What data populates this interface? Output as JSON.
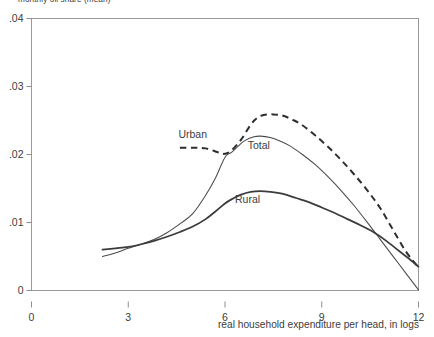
{
  "chart_data": {
    "type": "line",
    "title": "monthly oil share (mean)",
    "xlabel": "real household expenditure per head, in logs",
    "ylabel": "",
    "xlim": [
      0,
      12
    ],
    "ylim": [
      0,
      0.04
    ],
    "xticks": [
      0,
      3,
      6,
      9,
      12
    ],
    "xtick_labels": [
      "0",
      "3",
      "6",
      "9",
      "12"
    ],
    "yticks": [
      0,
      0.01,
      0.02,
      0.03,
      0.04
    ],
    "ytick_labels": [
      "0",
      ".01",
      ".02",
      ".03",
      ".04"
    ],
    "grid": false,
    "legend_position": "inline-annotations",
    "series": [
      {
        "name": "Urban",
        "style": "dashed",
        "label_x": 5.0,
        "label_y": 0.0225,
        "x": [
          4.6,
          5.0,
          5.4,
          5.8,
          6.0,
          6.2,
          6.5,
          6.8,
          7.0,
          7.2,
          7.5,
          7.8,
          8.1,
          8.4,
          8.8,
          9.2,
          9.6,
          10.0,
          10.4,
          10.8,
          11.2,
          11.6,
          12.0
        ],
        "y": [
          0.021,
          0.021,
          0.0209,
          0.0203,
          0.0201,
          0.0206,
          0.0222,
          0.0244,
          0.0254,
          0.0258,
          0.0259,
          0.0257,
          0.0251,
          0.0243,
          0.0228,
          0.0211,
          0.0192,
          0.0171,
          0.0148,
          0.0122,
          0.009,
          0.0058,
          0.0034
        ]
      },
      {
        "name": "Total",
        "style": "solid-thin",
        "label_x": 7.05,
        "label_y": 0.0208,
        "x": [
          2.2,
          2.6,
          3.0,
          3.4,
          3.8,
          4.2,
          4.6,
          5.0,
          5.4,
          5.7,
          6.0,
          6.2,
          6.4,
          6.6,
          6.9,
          7.1,
          7.4,
          7.7,
          8.0,
          8.4,
          8.8,
          9.2,
          9.6,
          10.0,
          10.4,
          10.8,
          11.2,
          11.6,
          12.0
        ],
        "y": [
          0.005,
          0.0055,
          0.0062,
          0.0068,
          0.0075,
          0.0085,
          0.0098,
          0.0113,
          0.014,
          0.0165,
          0.0196,
          0.0203,
          0.0212,
          0.022,
          0.0226,
          0.0227,
          0.0225,
          0.022,
          0.0213,
          0.02,
          0.0185,
          0.0167,
          0.0147,
          0.0125,
          0.0101,
          0.0076,
          0.0051,
          0.0026,
          0.0001
        ]
      },
      {
        "name": "Rural",
        "style": "solid-thick",
        "label_x": 6.7,
        "label_y": 0.0128,
        "x": [
          2.2,
          2.6,
          3.0,
          3.4,
          3.8,
          4.2,
          4.6,
          5.0,
          5.4,
          5.8,
          6.0,
          6.2,
          6.5,
          6.8,
          7.1,
          7.4,
          7.8,
          8.2,
          8.6,
          9.0,
          9.4,
          9.8,
          10.2,
          10.6,
          11.0,
          11.4,
          11.7,
          12.0
        ],
        "y": [
          0.006,
          0.0062,
          0.0064,
          0.0068,
          0.0073,
          0.0079,
          0.0086,
          0.0094,
          0.0105,
          0.012,
          0.0128,
          0.0134,
          0.0141,
          0.0145,
          0.0146,
          0.0145,
          0.0142,
          0.0136,
          0.013,
          0.0122,
          0.0114,
          0.0105,
          0.0096,
          0.0086,
          0.0073,
          0.0058,
          0.0047,
          0.0035
        ]
      }
    ]
  }
}
